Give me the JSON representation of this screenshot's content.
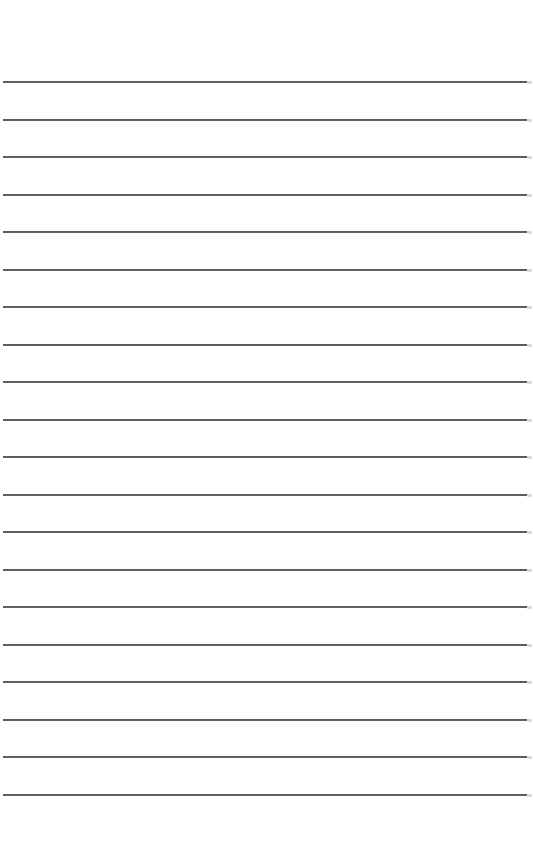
{
  "page": {
    "type": "lined-paper",
    "background_color": "#ffffff",
    "line_color": "#555555",
    "line_count": 20,
    "first_line_y": 81,
    "line_spacing": 37.5,
    "line_left": 3,
    "line_width": 524,
    "text": ""
  }
}
